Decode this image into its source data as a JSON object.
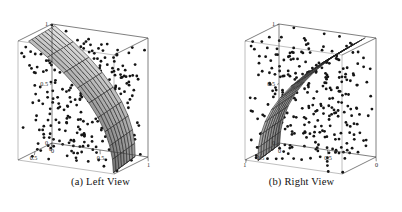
{
  "figure": {
    "background_color": "#ffffff",
    "panels": [
      {
        "id": "left-view",
        "caption": "(a) Left View",
        "axes": {
          "vertical_ticks": [
            "1",
            "0.5",
            "0"
          ],
          "bottom_left_ticks": [
            "0",
            "0.5"
          ],
          "bottom_right_ticks": [
            "0",
            "0.5",
            "1"
          ]
        }
      },
      {
        "id": "right-view",
        "caption": "(b) Right View",
        "axes": {
          "vertical_ticks": [
            "1",
            "0.5",
            "0"
          ],
          "bottom_left_ticks": [
            "1",
            "0.5"
          ],
          "bottom_right_ticks": [
            "0",
            "0.5",
            "0"
          ]
        }
      }
    ]
  },
  "chart_data": {
    "type": "scatter",
    "title": "",
    "subtitle": "",
    "xlabel": "",
    "ylabel": "",
    "zlabel": "",
    "xlim": [
      0,
      1
    ],
    "ylim": [
      0,
      1
    ],
    "zlim": [
      0,
      1
    ],
    "grid": false,
    "legend": "none",
    "views": [
      {
        "name": "(a) Left View",
        "surface": {
          "style": "wireframe-shaded",
          "fill_color": "#a9a9a9",
          "line_color": "#1c1c1c",
          "u_divisions": 8,
          "v_divisions": 9,
          "curvature": "concave-left, sweeping from top-left corner down to the front-bottom center"
        },
        "scatter": {
          "n_points": 300,
          "marker": "dot",
          "marker_color": "#151515",
          "marker_size_px": 1.4
        },
        "axis_ticks": {
          "vertical": [
            {
              "label": "1",
              "value": 1
            },
            {
              "label": "0.5",
              "value": 0.5
            },
            {
              "label": "0",
              "value": 0
            }
          ],
          "bottom_left": [
            {
              "label": "0",
              "value": 0
            },
            {
              "label": "0.5",
              "value": 0.5
            }
          ],
          "bottom_right": [
            {
              "label": "0",
              "value": 0
            },
            {
              "label": "0.5",
              "value": 0.5
            },
            {
              "label": "1",
              "value": 1
            }
          ]
        }
      },
      {
        "name": "(b) Right View",
        "surface": {
          "style": "wireframe-shaded",
          "fill_color": "#a9a9a9",
          "line_color": "#1c1c1c",
          "u_divisions": 8,
          "v_divisions": 9,
          "curvature": "convex-right, sweeping from top-right corner down to the front-bottom center"
        },
        "scatter": {
          "n_points": 300,
          "marker": "dot",
          "marker_color": "#151515",
          "marker_size_px": 1.4
        },
        "axis_ticks": {
          "vertical": [
            {
              "label": "1",
              "value": 1
            },
            {
              "label": "0.5",
              "value": 0.5
            },
            {
              "label": "0",
              "value": 0
            }
          ],
          "bottom_left": [
            {
              "label": "1",
              "value": 1
            },
            {
              "label": "0.5",
              "value": 0.5
            }
          ],
          "bottom_right": [
            {
              "label": "0",
              "value": 0
            },
            {
              "label": "0.5",
              "value": 0.5
            },
            {
              "label": "0",
              "value": 0
            }
          ]
        }
      }
    ]
  }
}
